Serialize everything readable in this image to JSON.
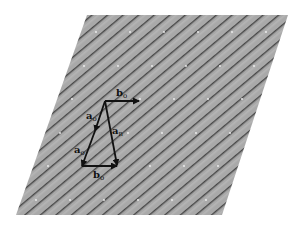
{
  "diagram": {
    "type": "lattice-vector-diagram",
    "colors": {
      "background": "#ffffff",
      "plane_fill": "#a9a9a9",
      "stripe": "#4a4a4a",
      "stripe_light": "#c4c4c4",
      "lattice_dot": "#f2f2f2",
      "vector": "#111111"
    },
    "plane": {
      "shape": "parallelogram",
      "points": "87,15 288,15 222,215 16,215"
    },
    "vectors": [
      {
        "id": "b_o_top",
        "from": [
          105,
          101
        ],
        "to": [
          139,
          101
        ],
        "label": "b",
        "subscript": "o",
        "label_pos": [
          116,
          95
        ]
      },
      {
        "id": "a_o_left",
        "from": [
          105,
          101
        ],
        "to": [
          82,
          166
        ],
        "label": "a",
        "subscript": "o",
        "label_pos": [
          86,
          118
        ],
        "mid_arrow": true
      },
      {
        "id": "a_n",
        "from": [
          105,
          101
        ],
        "to": [
          117,
          165
        ],
        "label": "a",
        "subscript": "n",
        "label_pos": [
          113,
          133
        ]
      },
      {
        "id": "b_o_bottom",
        "from": [
          82,
          166
        ],
        "to": [
          117,
          166
        ],
        "label": "b",
        "subscript": "o",
        "label_pos": [
          93,
          178
        ]
      }
    ],
    "extra_labels": [
      {
        "label": "a",
        "subscript": "o",
        "pos": [
          74,
          153
        ]
      }
    ]
  }
}
